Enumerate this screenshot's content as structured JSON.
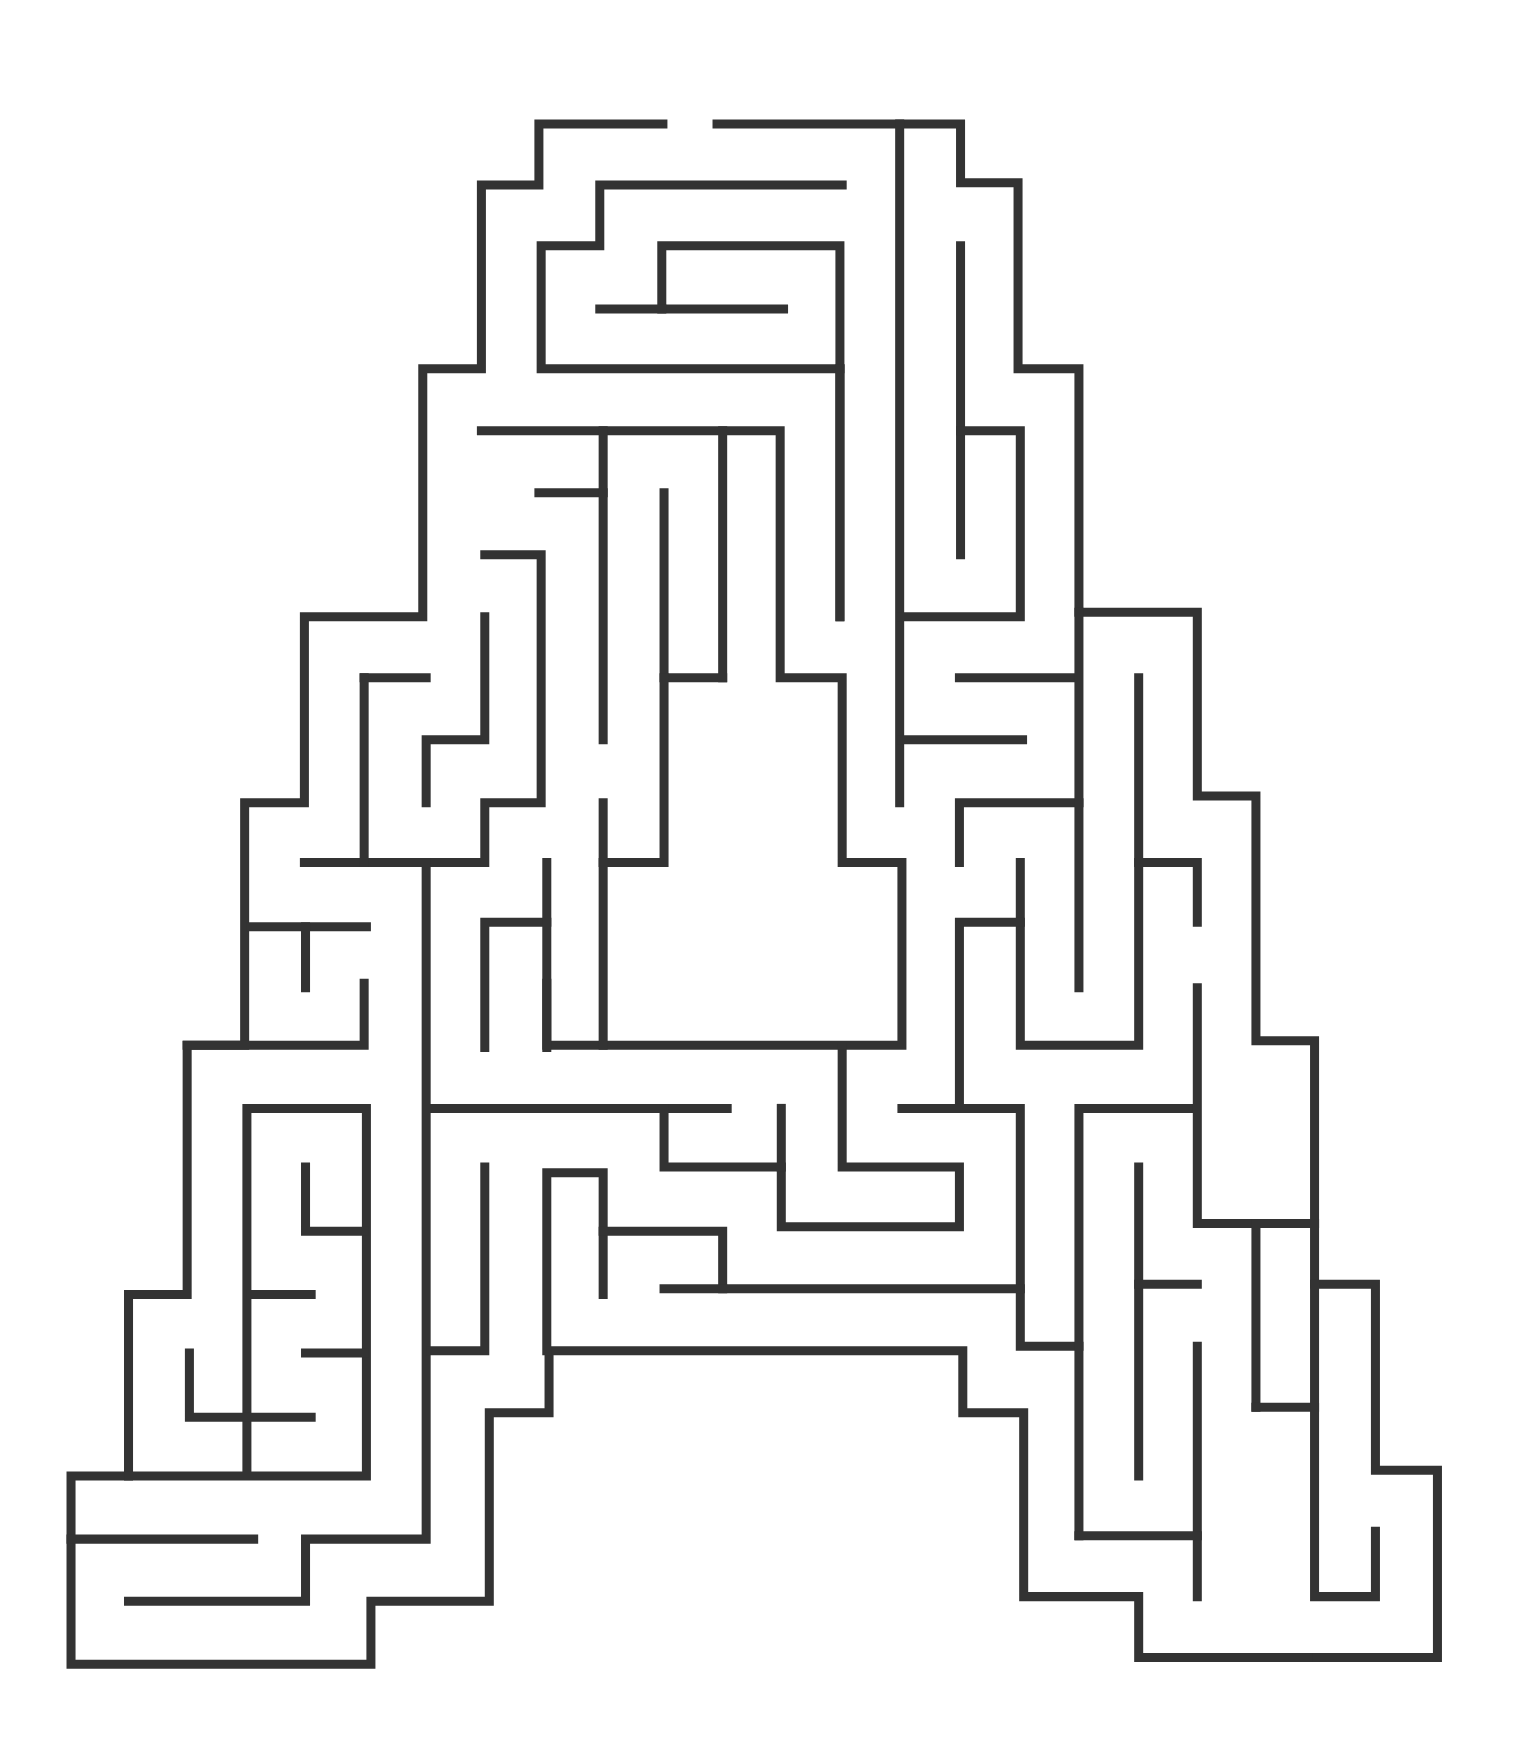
{
  "puzzle": {
    "type": "maze",
    "shape": "letter A",
    "entrance_side": "top",
    "exit_side": "bottom-right"
  },
  "style": {
    "wall_color": "#333333",
    "background": "#ffffff",
    "wall_width": 8
  },
  "walls": [
    [
      [
        588,
        110
      ],
      [
        478,
        110
      ],
      [
        478,
        164
      ],
      [
        427,
        164
      ],
      [
        427,
        327
      ],
      [
        375,
        327
      ],
      [
        375,
        547
      ],
      [
        270,
        547
      ],
      [
        270,
        712
      ],
      [
        217,
        712
      ],
      [
        217,
        927
      ],
      [
        166,
        927
      ],
      [
        166,
        1148
      ],
      [
        114,
        1148
      ],
      [
        114,
        1309
      ],
      [
        63,
        1309
      ],
      [
        63,
        1476
      ],
      [
        329,
        1476
      ],
      [
        329,
        1420
      ],
      [
        434,
        1420
      ],
      [
        434,
        1253
      ],
      [
        487,
        1253
      ],
      [
        487,
        1198
      ],
      [
        854,
        1198
      ],
      [
        854,
        1253
      ],
      [
        908,
        1253
      ],
      [
        908,
        1416
      ],
      [
        1010,
        1416
      ],
      [
        1010,
        1470
      ],
      [
        1166,
        1470
      ]
    ],
    [
      [
        636,
        110
      ],
      [
        852,
        110
      ],
      [
        852,
        162
      ],
      [
        903,
        162
      ],
      [
        903,
        327
      ],
      [
        957,
        327
      ],
      [
        957,
        543
      ],
      [
        1062,
        543
      ],
      [
        1062,
        706
      ],
      [
        1114,
        706
      ],
      [
        1114,
        923
      ],
      [
        1166,
        923
      ],
      [
        1166,
        1139
      ],
      [
        1220,
        1139
      ],
      [
        1220,
        1304
      ],
      [
        1275,
        1304
      ],
      [
        1275,
        1470
      ],
      [
        1168,
        1470
      ]
    ],
    [
      [
        798,
        110
      ],
      [
        798,
        712
      ]
    ],
    [
      [
        747,
        164
      ],
      [
        532,
        164
      ],
      [
        532,
        218
      ],
      [
        480,
        218
      ],
      [
        480,
        327
      ],
      [
        745,
        327
      ]
    ],
    [
      [
        745,
        547
      ],
      [
        745,
        218
      ],
      [
        587,
        218
      ],
      [
        587,
        274
      ],
      [
        695,
        274
      ]
    ],
    [
      [
        587,
        274
      ],
      [
        532,
        274
      ]
    ],
    [
      [
        745,
        327
      ],
      [
        745,
        547
      ]
    ],
    [
      [
        852,
        218
      ],
      [
        852,
        492
      ]
    ],
    [
      [
        852,
        382
      ],
      [
        905,
        382
      ],
      [
        905,
        547
      ],
      [
        800,
        547
      ]
    ],
    [
      [
        427,
        382
      ],
      [
        692,
        382
      ],
      [
        692,
        601
      ],
      [
        747,
        601
      ],
      [
        747,
        765
      ],
      [
        800,
        765
      ],
      [
        800,
        927
      ],
      [
        485,
        927
      ],
      [
        485,
        872
      ]
    ],
    [
      [
        478,
        437
      ],
      [
        535,
        437
      ]
    ],
    [
      [
        430,
        492
      ],
      [
        480,
        492
      ],
      [
        480,
        712
      ],
      [
        430,
        712
      ],
      [
        430,
        765
      ],
      [
        270,
        765
      ]
    ],
    [
      [
        535,
        382
      ],
      [
        535,
        656
      ]
    ],
    [
      [
        589,
        437
      ],
      [
        589,
        601
      ],
      [
        641,
        601
      ]
    ],
    [
      [
        641,
        382
      ],
      [
        641,
        601
      ]
    ],
    [
      [
        535,
        712
      ],
      [
        535,
        927
      ]
    ],
    [
      [
        589,
        601
      ],
      [
        589,
        765
      ],
      [
        535,
        765
      ]
    ],
    [
      [
        851,
        601
      ],
      [
        951,
        601
      ]
    ],
    [
      [
        800,
        656
      ],
      [
        907,
        656
      ]
    ],
    [
      [
        851,
        765
      ],
      [
        851,
        712
      ],
      [
        957,
        712
      ]
    ],
    [
      [
        957,
        543
      ],
      [
        957,
        876
      ]
    ],
    [
      [
        1010,
        601
      ],
      [
        1010,
        927
      ],
      [
        905,
        927
      ],
      [
        905,
        765
      ]
    ],
    [
      [
        1010,
        765
      ],
      [
        1062,
        765
      ],
      [
        1062,
        818
      ]
    ],
    [
      [
        851,
        976
      ],
      [
        851,
        818
      ],
      [
        905,
        818
      ]
    ],
    [
      [
        323,
        601
      ],
      [
        378,
        601
      ]
    ],
    [
      [
        323,
        601
      ],
      [
        323,
        765
      ]
    ],
    [
      [
        378,
        712
      ],
      [
        378,
        656
      ],
      [
        430,
        656
      ],
      [
        430,
        547
      ]
    ],
    [
      [
        223,
        822
      ],
      [
        325,
        822
      ]
    ],
    [
      [
        271,
        822
      ],
      [
        271,
        876
      ]
    ],
    [
      [
        323,
        872
      ],
      [
        323,
        927
      ],
      [
        166,
        927
      ]
    ],
    [
      [
        378,
        765
      ],
      [
        378,
        1365
      ],
      [
        271,
        1365
      ],
      [
        271,
        1420
      ],
      [
        114,
        1420
      ]
    ],
    [
      [
        382,
        983
      ],
      [
        645,
        983
      ]
    ],
    [
      [
        430,
        929
      ],
      [
        430,
        818
      ],
      [
        485,
        818
      ]
    ],
    [
      [
        485,
        765
      ],
      [
        485,
        929
      ]
    ],
    [
      [
        589,
        983
      ],
      [
        589,
        1035
      ],
      [
        693,
        1035
      ],
      [
        693,
        1088
      ],
      [
        851,
        1088
      ],
      [
        851,
        1035
      ],
      [
        747,
        1035
      ],
      [
        747,
        929
      ]
    ],
    [
      [
        693,
        983
      ],
      [
        693,
        1035
      ]
    ],
    [
      [
        800,
        983
      ],
      [
        905,
        983
      ],
      [
        905,
        1194
      ],
      [
        957,
        1194
      ]
    ],
    [
      [
        957,
        1362
      ],
      [
        957,
        983
      ],
      [
        1060,
        983
      ]
    ],
    [
      [
        1062,
        876
      ],
      [
        1062,
        1085
      ],
      [
        1114,
        1085
      ],
      [
        1114,
        1248
      ]
    ],
    [
      [
        1114,
        1085
      ],
      [
        1166,
        1085
      ]
    ],
    [
      [
        1010,
        1035
      ],
      [
        1010,
        1309
      ]
    ],
    [
      [
        1010,
        1139
      ],
      [
        1062,
        1139
      ]
    ],
    [
      [
        1062,
        1194
      ],
      [
        1062,
        1416
      ]
    ],
    [
      [
        957,
        1362
      ],
      [
        1062,
        1362
      ]
    ],
    [
      [
        1166,
        1248
      ],
      [
        1114,
        1248
      ]
    ],
    [
      [
        1166,
        1139
      ],
      [
        1166,
        1416
      ],
      [
        1220,
        1416
      ],
      [
        1220,
        1358
      ]
    ],
    [
      [
        485,
        1198
      ],
      [
        485,
        1040
      ],
      [
        535,
        1040
      ],
      [
        535,
        1148
      ]
    ],
    [
      [
        535,
        1092
      ],
      [
        641,
        1092
      ],
      [
        641,
        1143
      ],
      [
        905,
        1143
      ]
    ],
    [
      [
        589,
        1143
      ],
      [
        641,
        1143
      ]
    ],
    [
      [
        430,
        1035
      ],
      [
        430,
        1198
      ],
      [
        382,
        1198
      ]
    ],
    [
      [
        219,
        1309
      ],
      [
        219,
        983
      ],
      [
        325,
        983
      ],
      [
        325,
        1309
      ],
      [
        114,
        1309
      ]
    ],
    [
      [
        271,
        1035
      ],
      [
        271,
        1092
      ],
      [
        323,
        1092
      ]
    ],
    [
      [
        223,
        1148
      ],
      [
        276,
        1148
      ]
    ],
    [
      [
        271,
        1200
      ],
      [
        323,
        1200
      ]
    ],
    [
      [
        168,
        1200
      ],
      [
        168,
        1257
      ],
      [
        276,
        1257
      ]
    ],
    [
      [
        63,
        1365
      ],
      [
        225,
        1365
      ]
    ]
  ]
}
